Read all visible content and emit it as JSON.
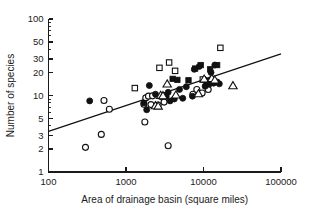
{
  "chart_data": {
    "type": "scatter",
    "title": "",
    "xlabel": "Area of drainage basin (square miles)",
    "ylabel": "Number of species",
    "xscale": "log",
    "yscale": "log",
    "xlim": [
      100,
      100000
    ],
    "ylim": [
      1,
      100
    ],
    "grid": false,
    "legend": "none",
    "xticks": [
      100,
      1000,
      10000,
      100000
    ],
    "xtick_labels": [
      "100",
      "1000",
      "10000",
      "100000"
    ],
    "yticks": [
      1,
      2,
      3,
      5,
      10,
      20,
      30,
      50,
      100
    ],
    "ytick_labels": [
      "1",
      "2",
      "3",
      "5",
      "10",
      "20",
      "30",
      "50",
      "100"
    ],
    "series": [
      {
        "name": "open-circle",
        "marker": "open circle",
        "points": [
          {
            "x": 300,
            "y": 2.1
          },
          {
            "x": 480,
            "y": 3.1
          },
          {
            "x": 520,
            "y": 8.6
          },
          {
            "x": 610,
            "y": 6.6
          },
          {
            "x": 1750,
            "y": 4.5
          },
          {
            "x": 1800,
            "y": 9.3
          },
          {
            "x": 1950,
            "y": 9.8
          },
          {
            "x": 2100,
            "y": 7.6
          },
          {
            "x": 2200,
            "y": 9.9
          },
          {
            "x": 2600,
            "y": 7.5
          },
          {
            "x": 2900,
            "y": 9.6
          },
          {
            "x": 3100,
            "y": 8.2
          },
          {
            "x": 3500,
            "y": 2.2
          },
          {
            "x": 7300,
            "y": 10.4
          },
          {
            "x": 8200,
            "y": 12.0
          },
          {
            "x": 9600,
            "y": 10.8
          },
          {
            "x": 10500,
            "y": 15.8
          },
          {
            "x": 11500,
            "y": 12.0
          },
          {
            "x": 12500,
            "y": 16.0
          },
          {
            "x": 1700,
            "y": 7.7
          }
        ]
      },
      {
        "name": "filled-circle",
        "marker": "filled circle",
        "points": [
          {
            "x": 340,
            "y": 8.5
          },
          {
            "x": 1700,
            "y": 8.0
          },
          {
            "x": 1850,
            "y": 6.5
          },
          {
            "x": 2000,
            "y": 13.5
          },
          {
            "x": 2400,
            "y": 10.4
          },
          {
            "x": 3300,
            "y": 9.8
          },
          {
            "x": 3500,
            "y": 11.0
          },
          {
            "x": 3700,
            "y": 8.5
          },
          {
            "x": 4200,
            "y": 9.0
          },
          {
            "x": 4900,
            "y": 12.0
          },
          {
            "x": 5400,
            "y": 9.2
          },
          {
            "x": 6000,
            "y": 13.0
          },
          {
            "x": 7200,
            "y": 9.8
          },
          {
            "x": 7600,
            "y": 22.0
          },
          {
            "x": 8800,
            "y": 24.0
          },
          {
            "x": 10500,
            "y": 13.2
          },
          {
            "x": 11200,
            "y": 15.0
          },
          {
            "x": 11800,
            "y": 14.0
          },
          {
            "x": 12500,
            "y": 20.0
          },
          {
            "x": 13500,
            "y": 14.5
          },
          {
            "x": 14000,
            "y": 25.0
          },
          {
            "x": 15000,
            "y": 15.0
          },
          {
            "x": 16000,
            "y": 14.2
          }
        ]
      },
      {
        "name": "open-square",
        "marker": "open square",
        "points": [
          {
            "x": 1300,
            "y": 12.5
          },
          {
            "x": 2700,
            "y": 23.0
          },
          {
            "x": 3600,
            "y": 27.0
          },
          {
            "x": 4300,
            "y": 21.0
          },
          {
            "x": 9800,
            "y": 16.2
          },
          {
            "x": 16500,
            "y": 42.0
          }
        ]
      },
      {
        "name": "filled-square",
        "marker": "filled square",
        "points": [
          {
            "x": 4000,
            "y": 16.5
          },
          {
            "x": 4600,
            "y": 16.0
          },
          {
            "x": 6400,
            "y": 15.8
          },
          {
            "x": 7800,
            "y": 22.5
          },
          {
            "x": 9200,
            "y": 25.0
          },
          {
            "x": 11000,
            "y": 15.5
          },
          {
            "x": 12200,
            "y": 22.0
          },
          {
            "x": 15000,
            "y": 25.0
          }
        ]
      },
      {
        "name": "open-triangle",
        "marker": "open triangle",
        "points": [
          {
            "x": 2400,
            "y": 7.4
          },
          {
            "x": 2600,
            "y": 7.3
          },
          {
            "x": 2800,
            "y": 10.1
          },
          {
            "x": 3000,
            "y": 10.0
          },
          {
            "x": 3400,
            "y": 14.2
          },
          {
            "x": 4400,
            "y": 10.2
          },
          {
            "x": 8600,
            "y": 10.6
          },
          {
            "x": 10200,
            "y": 16.5
          },
          {
            "x": 12800,
            "y": 16.8
          },
          {
            "x": 14000,
            "y": 16.0
          },
          {
            "x": 24000,
            "y": 13.5
          }
        ]
      }
    ],
    "fit_line": {
      "name": "regression line",
      "x_start": 100,
      "y_start": 3.4,
      "x_end": 100000,
      "y_end": 35.0
    }
  }
}
